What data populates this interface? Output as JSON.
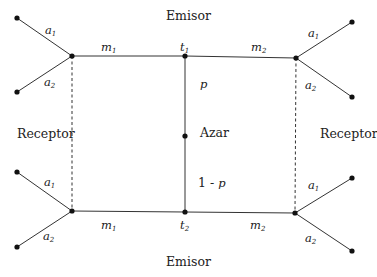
{
  "diagram": {
    "labels": {
      "emisor_top": "Emisor",
      "emisor_bottom": "Emisor",
      "receptor_left": "Receptor",
      "receptor_right": "Receptor",
      "azar": "Azar",
      "p": "p",
      "one_minus_p_prefix": "1 - ",
      "one_minus_p_var": "p"
    },
    "edge_labels": {
      "a": "a",
      "m": "m",
      "t": "t",
      "sub1": "1",
      "sub2": "2"
    },
    "nodes": [
      {
        "id": "top-left-hub",
        "x": 72,
        "y": 56
      },
      {
        "id": "t1",
        "x": 185,
        "y": 56
      },
      {
        "id": "top-right-hub",
        "x": 296,
        "y": 58
      },
      {
        "id": "azar",
        "x": 185,
        "y": 136
      },
      {
        "id": "bottom-left-hub",
        "x": 72,
        "y": 211
      },
      {
        "id": "t2",
        "x": 185,
        "y": 212
      },
      {
        "id": "bottom-right-hub",
        "x": 295,
        "y": 213
      },
      {
        "id": "leaf-tl-a1",
        "x": 17,
        "y": 18
      },
      {
        "id": "leaf-tl-a2",
        "x": 17,
        "y": 92
      },
      {
        "id": "leaf-tr-a1",
        "x": 352,
        "y": 22
      },
      {
        "id": "leaf-tr-a2",
        "x": 352,
        "y": 97
      },
      {
        "id": "leaf-bl-a1",
        "x": 17,
        "y": 172
      },
      {
        "id": "leaf-bl-a2",
        "x": 17,
        "y": 247
      },
      {
        "id": "leaf-br-a1",
        "x": 352,
        "y": 178
      },
      {
        "id": "leaf-br-a2",
        "x": 352,
        "y": 251
      }
    ]
  }
}
